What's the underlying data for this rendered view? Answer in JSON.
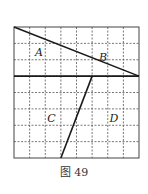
{
  "figure": {
    "caption": "图 49",
    "grid": {
      "cols": 8,
      "rows": 8,
      "x0": 14,
      "y0": 27,
      "x1": 139,
      "y1": 158,
      "grid_color": "#555555",
      "line_color": "#1a1a1a"
    },
    "segments": [
      {
        "name": "diagonal-top",
        "from": [
          0,
          0
        ],
        "to": [
          8,
          3
        ]
      },
      {
        "name": "horizontal-divider",
        "from": [
          0,
          3
        ],
        "to": [
          8,
          3
        ]
      },
      {
        "name": "slanted-lower",
        "from": [
          5,
          3
        ],
        "to": [
          3,
          8
        ]
      }
    ],
    "labels": [
      {
        "text": "A",
        "gx": 1.6,
        "gy": 1.6
      },
      {
        "text": "B",
        "gx": 5.7,
        "gy": 1.9
      },
      {
        "text": "C",
        "gx": 2.4,
        "gy": 5.6
      },
      {
        "text": "D",
        "gx": 6.4,
        "gy": 5.6
      }
    ]
  }
}
